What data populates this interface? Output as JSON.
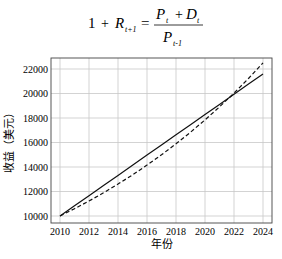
{
  "formula": {
    "lhs_one": "1",
    "plus": "+",
    "lhs_R": "R",
    "lhs_R_sub": "t+1",
    "equals": "=",
    "num_P": "P",
    "num_P_sub": "t",
    "num_D": "D",
    "num_D_sub": "t",
    "den_P": "P",
    "den_P_sub": "t-1"
  },
  "chart_data": {
    "type": "line",
    "title": "",
    "xlabel": "年份",
    "ylabel": "收益（美元）",
    "x": [
      2010,
      2011,
      2012,
      2013,
      2014,
      2015,
      2016,
      2017,
      2018,
      2019,
      2020,
      2021,
      2022,
      2023,
      2024
    ],
    "xticks": [
      "2010",
      "2012",
      "2014",
      "2016",
      "2018",
      "2020",
      "2022",
      "2024"
    ],
    "yticks": [
      "10000",
      "12000",
      "14000",
      "16000",
      "18000",
      "20000",
      "22000"
    ],
    "xlim": [
      2009.5,
      2024.5
    ],
    "ylim": [
      9500,
      23200
    ],
    "grid": true,
    "legend": "none",
    "series": [
      {
        "name": "solid",
        "style": "solid",
        "values": [
          10000,
          10829,
          11657,
          12486,
          13314,
          14143,
          14971,
          15800,
          16629,
          17457,
          18286,
          19114,
          19943,
          20771,
          21600
        ]
      },
      {
        "name": "dashed",
        "style": "dashed",
        "values": [
          10000,
          10596,
          11228,
          11897,
          12606,
          13357,
          14153,
          14997,
          15891,
          16838,
          17841,
          18905,
          20031,
          21225,
          22500
        ]
      }
    ]
  }
}
